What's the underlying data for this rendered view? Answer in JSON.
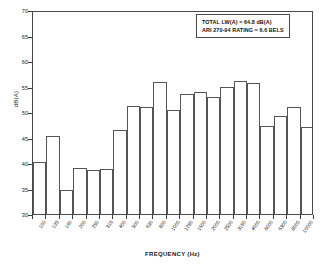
{
  "chart_data": {
    "type": "bar",
    "title": "",
    "xlabel": "FREQUENCY (Hz)",
    "ylabel": "dB(A)",
    "ylim": [
      30,
      70
    ],
    "ytick_labels": [
      "70",
      "65",
      "60",
      "55",
      "50",
      "45",
      "40",
      "35",
      "30"
    ],
    "yticks": [
      70,
      65,
      60,
      55,
      50,
      45,
      40,
      35,
      30
    ],
    "grid": false,
    "legend": null,
    "categories": [
      "100",
      "125",
      "160",
      "200",
      "250",
      "315",
      "400",
      "500",
      "630",
      "800",
      "1000",
      "1250",
      "1600",
      "2000",
      "2500",
      "3150",
      "4000",
      "5000",
      "6300",
      "8000",
      "10000"
    ],
    "values": [
      40.2,
      45.2,
      34.7,
      39.1,
      38.7,
      38.9,
      46.5,
      51.2,
      51.0,
      55.8,
      50.3,
      53.6,
      53.9,
      52.9,
      54.9,
      56.0,
      55.7,
      47.3,
      49.2,
      50.9,
      47.1
    ],
    "annotations": [
      "TOTAL LW(A) = 64.8 dB(A)",
      "ARI 270-94 RATING = 6.6 BELS"
    ]
  },
  "annotation_box": {
    "line1": "TOTAL LW(A) = 64.8 dB(A)",
    "line2": "ARI 270-94 RATING = 6.6 BELS"
  },
  "axes": {
    "y_title": "dB(A)",
    "x_title": "FREQUENCY (Hz)"
  }
}
